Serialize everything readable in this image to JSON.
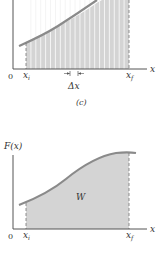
{
  "colors": {
    "axis": "#555555",
    "curve": "#8a8a8a",
    "fill": "#d4d4d4",
    "strip_line": "#f4f4f4",
    "dashed": "#777777",
    "text": "#333333"
  },
  "panel_c": {
    "axis_x_label": "x",
    "origin_label": "0",
    "xi_label": "x",
    "xi_sub": "i",
    "xf_label": "x",
    "xf_sub": "f",
    "delta_label": "Δx",
    "caption": "(c)",
    "strip_count": 21
  },
  "panel_d": {
    "axis_y_label": "F(x)",
    "axis_x_label": "x",
    "origin_label": "0",
    "xi_label": "x",
    "xi_sub": "i",
    "xf_label": "x",
    "xf_sub": "f",
    "area_label": "W"
  }
}
